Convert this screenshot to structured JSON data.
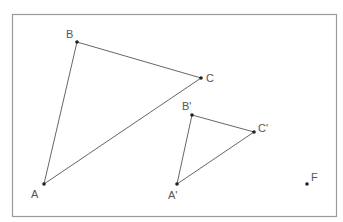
{
  "frame": {
    "x": 12.5,
    "y": 14.5,
    "width": 324,
    "height": 202,
    "stroke": "#9a9a9a"
  },
  "colors": {
    "line": "#555555",
    "point": "#222222",
    "label": "#555555"
  },
  "points": {
    "A": {
      "label": "A",
      "x": 44,
      "y": 184,
      "lx": 31,
      "ly": 198
    },
    "B": {
      "label": "B",
      "x": 77,
      "y": 42,
      "lx": 66,
      "ly": 38
    },
    "C": {
      "label": "C",
      "x": 201,
      "y": 78,
      "lx": 206,
      "ly": 82
    },
    "A'": {
      "label": "A'",
      "x": 177,
      "y": 184,
      "lx": 168,
      "ly": 199
    },
    "B'": {
      "label": "B'",
      "x": 192,
      "y": 115,
      "lx": 182,
      "ly": 110
    },
    "C'": {
      "label": "C'",
      "x": 254,
      "y": 132,
      "lx": 258,
      "ly": 132
    },
    "F": {
      "label": "F",
      "x": 307,
      "y": 184,
      "lx": 311,
      "ly": 181
    }
  },
  "triangles": [
    {
      "name": "triangle-abc",
      "vertices": [
        "A",
        "B",
        "C"
      ]
    },
    {
      "name": "triangle-a-prime-b-prime-c-prime",
      "vertices": [
        "A'",
        "B'",
        "C'"
      ]
    }
  ],
  "standalone_points": [
    "F"
  ]
}
